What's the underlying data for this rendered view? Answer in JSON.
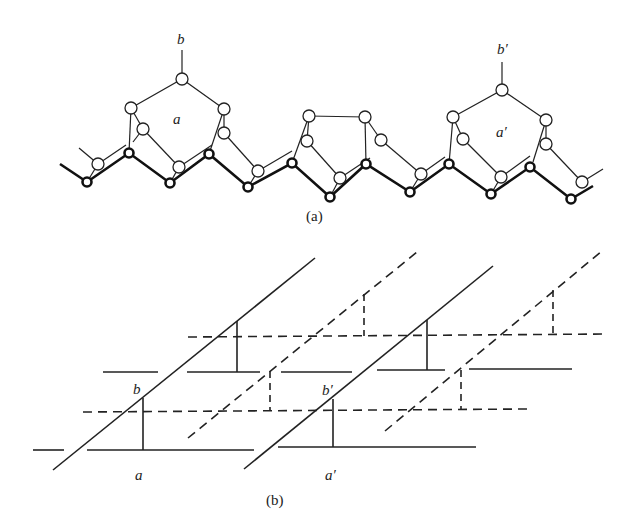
{
  "figure": {
    "panel_a": {
      "caption": "(a)",
      "labels": {
        "b": "b",
        "a": "a",
        "b_prime": "b′",
        "a_prime": "a′"
      },
      "description": "Zigzag chain of linked atoms forming ring units a and a′ with branches b and b′"
    },
    "panel_b": {
      "caption": "(b)",
      "labels": {
        "b": "b",
        "a": "a",
        "b_prime": "b′",
        "a_prime": "a′"
      },
      "description": "Schematic of parallel solid and dashed layers with diagonal links and vertical connectors"
    }
  },
  "colors": {
    "ink": "#222222",
    "background": "#ffffff"
  }
}
